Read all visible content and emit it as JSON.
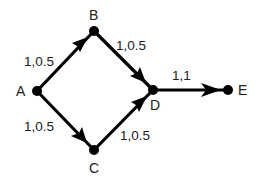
{
  "diagram": {
    "type": "directed-graph",
    "nodes": [
      {
        "id": "A",
        "label": "A",
        "x": 37,
        "y": 91
      },
      {
        "id": "B",
        "label": "B",
        "x": 94,
        "y": 31
      },
      {
        "id": "C",
        "label": "C",
        "x": 94,
        "y": 150
      },
      {
        "id": "D",
        "label": "D",
        "x": 153,
        "y": 90
      },
      {
        "id": "E",
        "label": "E",
        "x": 228,
        "y": 90
      }
    ],
    "edges": [
      {
        "from": "A",
        "to": "B",
        "label": "1,0.5"
      },
      {
        "from": "B",
        "to": "D",
        "label": "1,0.5"
      },
      {
        "from": "A",
        "to": "C",
        "label": "1,0.5"
      },
      {
        "from": "C",
        "to": "D",
        "label": "1,0.5"
      },
      {
        "from": "D",
        "to": "E",
        "label": "1,1"
      }
    ]
  }
}
